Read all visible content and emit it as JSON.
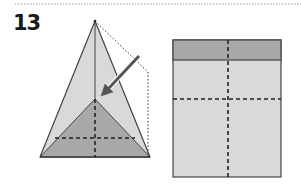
{
  "step": {
    "number": "13"
  },
  "colors": {
    "background": "#ffffff",
    "paper_light": "#d9d9d9",
    "paper_dark": "#a8a8a8",
    "outline": "#444444",
    "fold_line": "#222222",
    "arrow": "#555555",
    "separator": "#999999"
  },
  "diagram": {
    "left_figure": "triangle-fold-with-arrow",
    "right_figure": "rectangle-result-with-folded-strip"
  }
}
